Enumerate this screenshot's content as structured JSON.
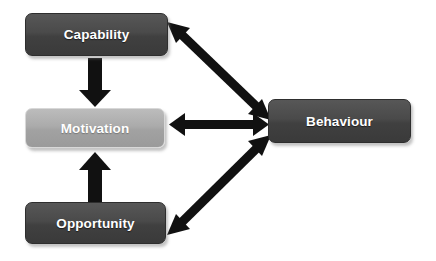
{
  "diagram": {
    "background_color": "#ffffff",
    "nodes": [
      {
        "id": "capability",
        "label": "Capability",
        "style": "dark",
        "fill_color": "#474747",
        "text_color": "#ffffff"
      },
      {
        "id": "motivation",
        "label": "Motivation",
        "style": "light",
        "fill_color": "#a8a8a8",
        "text_color": "#ffffff"
      },
      {
        "id": "opportunity",
        "label": "Opportunity",
        "style": "dark",
        "fill_color": "#474747",
        "text_color": "#ffffff"
      },
      {
        "id": "behaviour",
        "label": "Behaviour",
        "style": "dark",
        "fill_color": "#3f3f3f",
        "text_color": "#ffffff"
      }
    ],
    "connectors": [
      {
        "id": "capability-to-motivation",
        "from": "capability",
        "to": "motivation",
        "heads": "single",
        "direction": "down",
        "color": "#111111"
      },
      {
        "id": "opportunity-to-motivation",
        "from": "opportunity",
        "to": "motivation",
        "heads": "single",
        "direction": "up",
        "color": "#111111"
      },
      {
        "id": "capability-behaviour",
        "from": "capability",
        "to": "behaviour",
        "heads": "double",
        "direction": "diagonal-down-right",
        "color": "#111111"
      },
      {
        "id": "motivation-behaviour",
        "from": "motivation",
        "to": "behaviour",
        "heads": "double",
        "direction": "horizontal",
        "color": "#111111"
      },
      {
        "id": "opportunity-behaviour",
        "from": "opportunity",
        "to": "behaviour",
        "heads": "double",
        "direction": "diagonal-up-right",
        "color": "#111111"
      }
    ]
  }
}
